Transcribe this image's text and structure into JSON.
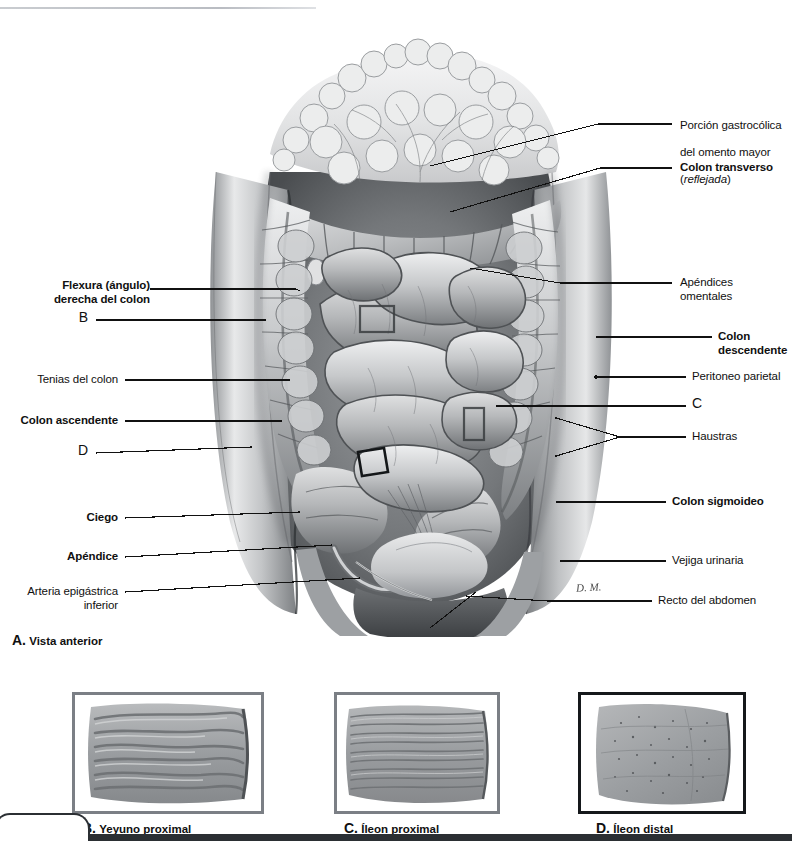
{
  "plate": {
    "figure_key": "A",
    "caption_key": "A.",
    "caption_text": "Vista anterior",
    "signature": "D. M."
  },
  "labels_left": [
    {
      "id": "flexura-derecha",
      "text": "Flexura (ángulo)\nderecha del colon",
      "bold": true
    },
    {
      "id": "marker-b",
      "text": "B",
      "bold": false
    },
    {
      "id": "tenias",
      "text": "Tenias del colon",
      "bold": false
    },
    {
      "id": "colon-ascendente",
      "text": "Colon ascendente",
      "bold": true
    },
    {
      "id": "marker-d",
      "text": "D",
      "bold": false
    },
    {
      "id": "ciego",
      "text": "Ciego",
      "bold": true
    },
    {
      "id": "apendice",
      "text": "Apéndice",
      "bold": true
    },
    {
      "id": "arteria-epigastrica",
      "text": "Arteria epigástrica\ninferior",
      "bold": false
    }
  ],
  "labels_right": [
    {
      "id": "porcion-gastrocolica",
      "line1": "Porción gastrocólica",
      "line2": "del omento mayor",
      "line3": "(reflejada)",
      "line3_italic_inner": "reflejada",
      "bold": false
    },
    {
      "id": "colon-transverso",
      "text": "Colon transverso",
      "bold": true
    },
    {
      "id": "apendices-omentales",
      "text": "Apéndices\nomentales",
      "bold": false
    },
    {
      "id": "colon-descendente",
      "text": "Colon\ndescendente",
      "bold": true
    },
    {
      "id": "peritoneo-parietal",
      "text": "Peritoneo parietal",
      "bold": false
    },
    {
      "id": "marker-c",
      "text": "C",
      "bold": false
    },
    {
      "id": "haustras",
      "text": "Haustras",
      "bold": false
    },
    {
      "id": "colon-sigmoideo",
      "text": "Colon sigmoideo",
      "bold": true
    },
    {
      "id": "vejiga-urinaria",
      "text": "Vejiga urinaria",
      "bold": false
    },
    {
      "id": "recto-abdomen",
      "text": "Recto del abdomen",
      "bold": false
    }
  ],
  "panels": [
    {
      "id": "panel-b",
      "key": "B.",
      "text": "Yeyuno proximal",
      "border": "gray",
      "border_color": "#7b7f85",
      "pattern": "thick-transverse-folds"
    },
    {
      "id": "panel-c",
      "key": "C.",
      "text": "Íleon proximal",
      "border": "gray",
      "border_color": "#7b7f85",
      "pattern": "thin-transverse-folds"
    },
    {
      "id": "panel-d",
      "key": "D.",
      "text": "Íleon distal",
      "border": "black",
      "border_color": "#15181b",
      "pattern": "smooth-speckled"
    }
  ],
  "colors": {
    "ink": "#101010",
    "leader": "#111111",
    "rule": "#c2c5ca",
    "footer": "#2b2f33",
    "panel_gray_border": "#7b7f85",
    "panel_black_border": "#15181b"
  }
}
